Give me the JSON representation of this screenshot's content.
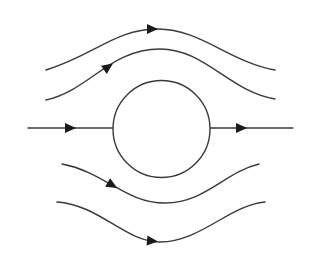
{
  "diagram": {
    "title": "",
    "colors": {
      "line": "#3a3a3a",
      "arrow": "#1a1a1a",
      "background": "#ffffff"
    },
    "obstacle": {
      "shape": "circle",
      "cx": 161.5,
      "cy": 129,
      "r": 48.5
    },
    "streamlines": [
      {
        "id": "upper-outer",
        "d": "M46,70 C95,55 115,29 158,29 C200,29 230,62 275,70",
        "arrow": {
          "x": 152,
          "y": 29,
          "angle": 0
        }
      },
      {
        "id": "upper-inner",
        "d": "M46,100 C90,90 110,49 160,49 C205,49 230,92 275,99",
        "arrow": {
          "x": 108,
          "y": 67,
          "angle": -35
        }
      },
      {
        "id": "center-left",
        "d": "M28,128 L113,128",
        "arrow": {
          "x": 70,
          "y": 128,
          "angle": 0
        }
      },
      {
        "id": "center-right",
        "d": "M210,128 L293,128",
        "arrow": {
          "x": 241,
          "y": 128,
          "angle": 0
        }
      },
      {
        "id": "lower-inner",
        "d": "M62,164 C105,172 125,203 165,203 C205,203 225,172 259,164",
        "arrow": {
          "x": 112,
          "y": 185,
          "angle": 30
        }
      },
      {
        "id": "lower-outer",
        "d": "M57,202 C100,205 125,242 160,242 C200,242 230,205 265,202",
        "arrow": {
          "x": 152,
          "y": 241,
          "angle": 5
        }
      }
    ]
  }
}
